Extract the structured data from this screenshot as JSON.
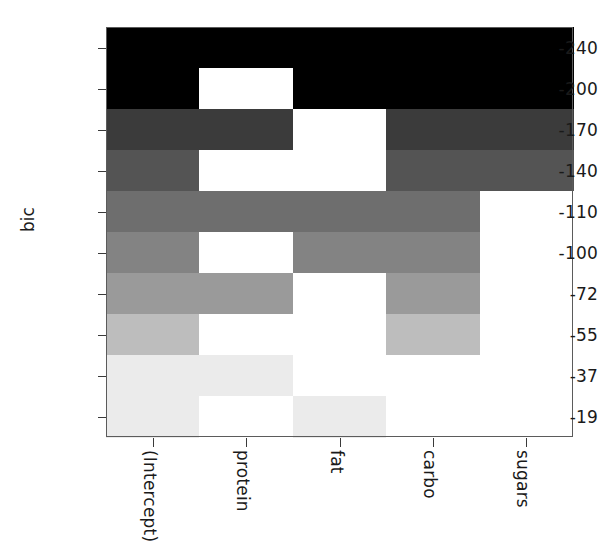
{
  "chart_data": {
    "type": "heatmap",
    "title": "",
    "xlabel": "",
    "ylabel": "bic",
    "categories": [
      "(Intercept)",
      "protein",
      "fat",
      "carbo",
      "sugars"
    ],
    "row_labels": [
      "-240",
      "-200",
      "-170",
      "-140",
      "-110",
      "-100",
      "-72",
      "-55",
      "-37",
      "-19"
    ],
    "row_values": [
      -240,
      -200,
      -170,
      -140,
      -110,
      -100,
      -72,
      -55,
      -37,
      -19
    ],
    "xtick_labels": [
      "(Intercept)",
      "protein",
      "fat",
      "carbo",
      "sugars"
    ],
    "ytick_labels": [
      "-240",
      "-200",
      "-170",
      "-140",
      "-110",
      "-100",
      "-72",
      "-55",
      "-37",
      "-19"
    ],
    "grid": false,
    "legend": "none",
    "included_matrix": [
      [
        1,
        1,
        1,
        1,
        1
      ],
      [
        1,
        0,
        1,
        1,
        1
      ],
      [
        1,
        1,
        0,
        1,
        1
      ],
      [
        1,
        0,
        0,
        1,
        1
      ],
      [
        1,
        1,
        1,
        1,
        0
      ],
      [
        1,
        0,
        1,
        1,
        0
      ],
      [
        1,
        1,
        0,
        1,
        0
      ],
      [
        1,
        0,
        0,
        1,
        0
      ],
      [
        1,
        1,
        0,
        0,
        0
      ],
      [
        1,
        0,
        1,
        0,
        0
      ]
    ],
    "row_shade_hex": [
      "#000000",
      "#000000",
      "#3b3b3b",
      "#545454",
      "#6e6e6e",
      "#838383",
      "#9a9a9a",
      "#bdbdbd",
      "#ebebeb",
      "#ebebeb"
    ],
    "excluded_hex": "#ffffff",
    "axis_color": "#3a3a3a",
    "frame_color": "#5b5b5b",
    "text_color": "#1a1a1a"
  },
  "axes": {
    "y_title": "bic",
    "y_ticks": [
      "-240",
      "-200",
      "-170",
      "-140",
      "-110",
      "-100",
      "-72",
      "-55",
      "-37",
      "-19"
    ],
    "x_ticks": [
      "(Intercept)",
      "protein",
      "fat",
      "carbo",
      "sugars"
    ]
  }
}
